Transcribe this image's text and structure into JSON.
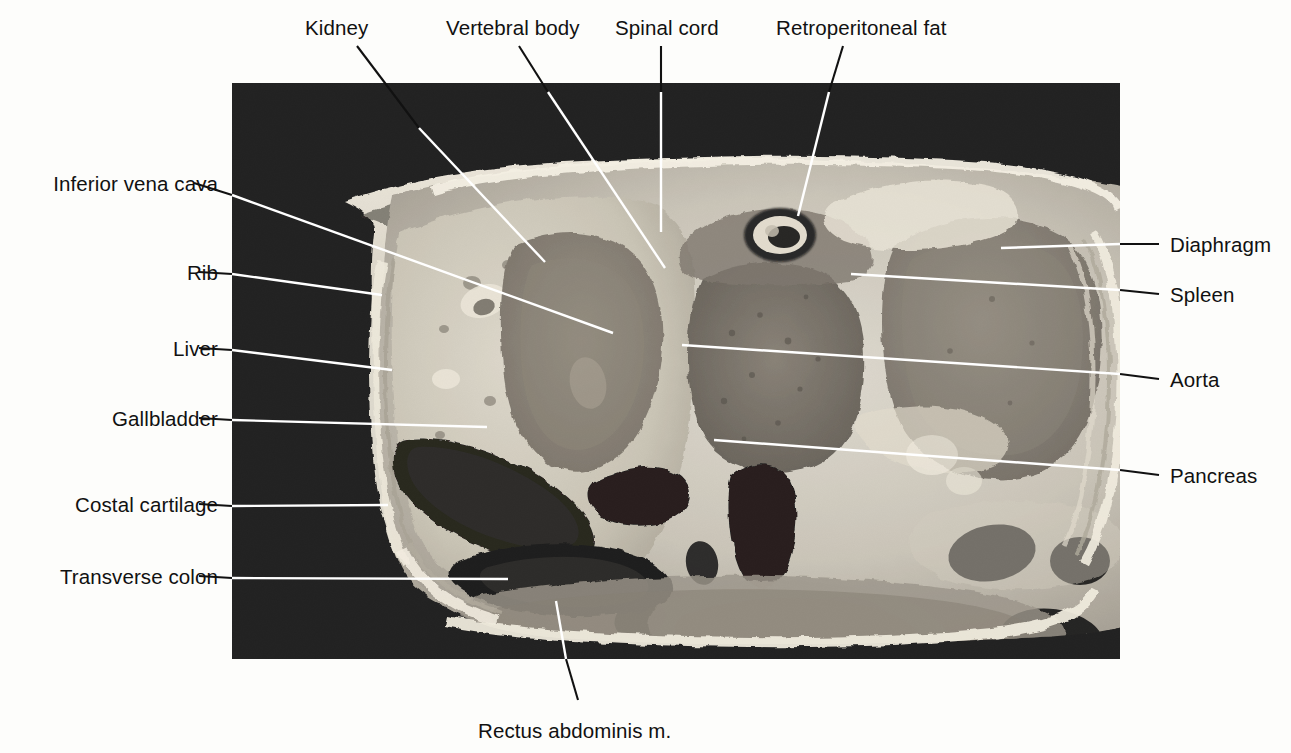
{
  "figure": {
    "kind": "anatomical-cross-section-photograph",
    "frame": {
      "x": 232,
      "y": 83,
      "width": 888,
      "height": 576,
      "background_color": "#050505"
    },
    "page_background_color": "#fdfdfb",
    "text_color": "#111111",
    "leader_color_outside": "#111111",
    "leader_color_inside": "#ffffff"
  },
  "labels": {
    "top": [
      {
        "id": "kidney",
        "text": "Kidney",
        "x": 305,
        "y": 16,
        "align": "left"
      },
      {
        "id": "vertebral-body",
        "text": "Vertebral body",
        "x": 446,
        "y": 16,
        "align": "left"
      },
      {
        "id": "spinal-cord",
        "text": "Spinal cord",
        "x": 615,
        "y": 16,
        "align": "left"
      },
      {
        "id": "retroperitoneal-fat",
        "text": "Retroperitoneal fat",
        "x": 776,
        "y": 16,
        "align": "left"
      }
    ],
    "left": [
      {
        "id": "inferior-vena-cava",
        "text": "Inferior vena cava",
        "right": 1073,
        "y": 172
      },
      {
        "id": "rib",
        "text": "Rib",
        "right": 1073,
        "y": 261
      },
      {
        "id": "liver",
        "text": "Liver",
        "right": 1073,
        "y": 337
      },
      {
        "id": "gallbladder",
        "text": "Gallbladder",
        "right": 1073,
        "y": 407
      },
      {
        "id": "costal-cartilage",
        "text": "Costal cartilage",
        "right": 1073,
        "y": 493
      },
      {
        "id": "transverse-colon",
        "text": "Transverse colon",
        "right": 1073,
        "y": 565
      }
    ],
    "right": [
      {
        "id": "diaphragm",
        "text": "Diaphragm",
        "x": 1170,
        "y": 233
      },
      {
        "id": "spleen",
        "text": "Spleen",
        "x": 1170,
        "y": 283
      },
      {
        "id": "aorta",
        "text": "Aorta",
        "x": 1170,
        "y": 368
      },
      {
        "id": "pancreas",
        "text": "Pancreas",
        "x": 1170,
        "y": 464
      }
    ],
    "bottom": [
      {
        "id": "rectus-abdominis",
        "text": "Rectus abdominis m.",
        "x": 478,
        "y": 719,
        "align": "left"
      }
    ]
  },
  "leaders": [
    {
      "id": "kidney",
      "outside": "M 357,46 L 419,128",
      "inside": "M 419,128 L 545,262"
    },
    {
      "id": "vertebral-body",
      "outside": "M 519,46 L 548,92",
      "inside": "M 548,92 L 665,268"
    },
    {
      "id": "spinal-cord",
      "outside": "M 661,46 L 661,92",
      "inside": "M 661,92 L 661,232"
    },
    {
      "id": "retroperitoneal-fat",
      "outside": "M 843,46 L 829,92",
      "inside": "M 829,92 L 798,216"
    },
    {
      "id": "inferior-vena-cava",
      "outside": "M 194,183 L 232,195",
      "inside": "M 232,195 L 613,333"
    },
    {
      "id": "rib",
      "outside": "M 199,272 L 232,274",
      "inside": "M 232,274 L 382,295"
    },
    {
      "id": "liver",
      "outside": "M 199,348 L 232,350",
      "inside": "M 232,350 L 392,370"
    },
    {
      "id": "gallbladder",
      "outside": "M 199,418 L 232,420",
      "inside": "M 232,420 L 487,427"
    },
    {
      "id": "costal-cartilage",
      "outside": "M 199,504 L 232,506",
      "inside": "M 232,506 L 388,505"
    },
    {
      "id": "transverse-colon",
      "outside": "M 199,576 L 232,578",
      "inside": "M 232,578 L 508,579"
    },
    {
      "id": "diaphragm",
      "outside": "M 1159,244 L 1120,244",
      "inside": "M 1120,244 L 1001,248"
    },
    {
      "id": "spleen",
      "outside": "M 1159,294 L 1120,290",
      "inside": "M 1120,290 L 851,274"
    },
    {
      "id": "aorta",
      "outside": "M 1159,379 L 1120,374",
      "inside": "M 1120,374 L 682,345"
    },
    {
      "id": "pancreas",
      "outside": "M 1159,475 L 1120,470",
      "inside": "M 1120,470 L 714,440"
    },
    {
      "id": "rectus-abdominis",
      "outside": "M 578,700 L 566,659",
      "inside": "M 566,659 L 556,601"
    }
  ],
  "anatomy_regions": [
    {
      "id": "body-wall",
      "label": "body wall / skin & subcutaneous fat"
    },
    {
      "id": "liver-parenchyma",
      "label": "liver"
    },
    {
      "id": "gallbladder-lumen",
      "label": "gallbladder"
    },
    {
      "id": "right-kidney",
      "label": "kidney"
    },
    {
      "id": "vertebral-body-bone",
      "label": "vertebral body"
    },
    {
      "id": "spinal-canal",
      "label": "spinal cord"
    },
    {
      "id": "spleen-mass",
      "label": "spleen"
    },
    {
      "id": "aorta-lumen",
      "label": "aorta"
    },
    {
      "id": "ivc-lumen",
      "label": "inferior vena cava"
    },
    {
      "id": "pancreas-body",
      "label": "pancreas"
    },
    {
      "id": "transverse-colon-lumen",
      "label": "transverse colon"
    },
    {
      "id": "rectus-muscle",
      "label": "rectus abdominis m."
    },
    {
      "id": "ribs",
      "label": "rib"
    },
    {
      "id": "costal-cartilages",
      "label": "costal cartilage"
    },
    {
      "id": "diaphragm-slip",
      "label": "diaphragm"
    },
    {
      "id": "retroperitoneal-fat-pad",
      "label": "retroperitoneal fat"
    }
  ]
}
